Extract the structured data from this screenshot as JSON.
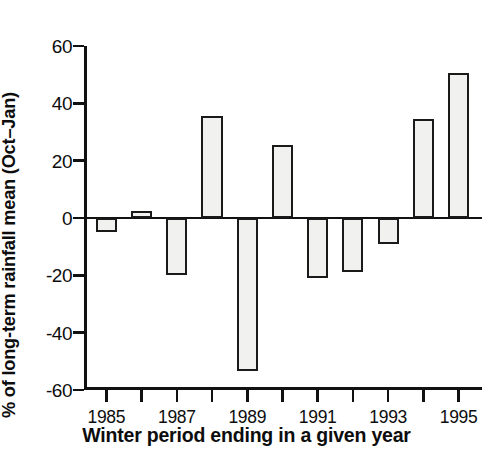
{
  "chart_data": {
    "type": "bar",
    "title": "",
    "xlabel": "Winter period ending in a given year",
    "ylabel": "% of long-term rainfall mean (Oct–Jan)",
    "categories": [
      "1985",
      "1986",
      "1987",
      "1988",
      "1989",
      "1990",
      "1991",
      "1992",
      "1993",
      "1994",
      "1995"
    ],
    "values": [
      -5,
      2.5,
      -20,
      35.5,
      -53.5,
      25.5,
      -21,
      -19,
      -9,
      34.5,
      50.5
    ],
    "xtick_labels_shown": [
      "1985",
      "1987",
      "1989",
      "1991",
      "1993",
      "1995"
    ],
    "ytick_labels": [
      "60",
      "40",
      "20",
      "0",
      "-20",
      "-40",
      "-60"
    ],
    "ytick_values": [
      60,
      40,
      20,
      0,
      -20,
      -40,
      -60
    ],
    "ylim": [
      -60,
      60
    ],
    "grid": false,
    "legend": false,
    "bar_fill_color": "#f1f1f0",
    "bar_edge_color": "#1a1a1a",
    "axis_color": "#111111",
    "background_color": "#ffffff"
  }
}
